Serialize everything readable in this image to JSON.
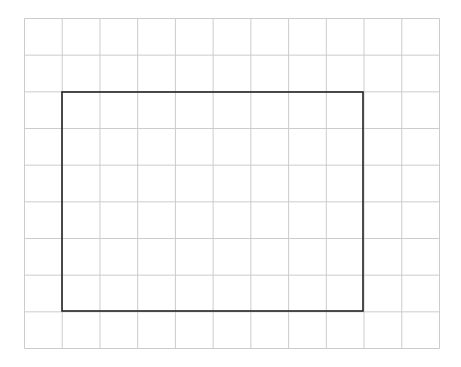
{
  "diagram": {
    "type": "grid-with-rectangle",
    "grid": {
      "columns": 11,
      "rows": 9,
      "left": 24.5,
      "top": 18.5,
      "right": 439.5,
      "bottom": 348.5,
      "line_color": "#cccccc",
      "line_width": 1
    },
    "rectangle": {
      "left": 62,
      "top": 92,
      "right": 363,
      "bottom": 311,
      "stroke_color": "#222222",
      "stroke_width": 1.6,
      "width_cells": 8,
      "height_cells": 6
    },
    "background": "#ffffff"
  }
}
